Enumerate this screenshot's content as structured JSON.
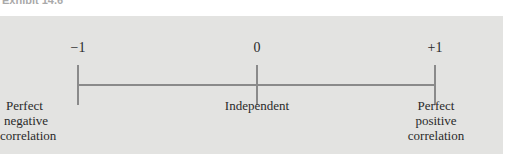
{
  "caption": "Exhibit 14.6",
  "scale": {
    "min_label": "−1",
    "mid_label": "0",
    "max_label": "+1",
    "min_desc": [
      "Perfect",
      "negative",
      "correlation"
    ],
    "mid_desc": [
      "Independent"
    ],
    "max_desc": [
      "Perfect",
      "positive",
      "correlation"
    ]
  }
}
